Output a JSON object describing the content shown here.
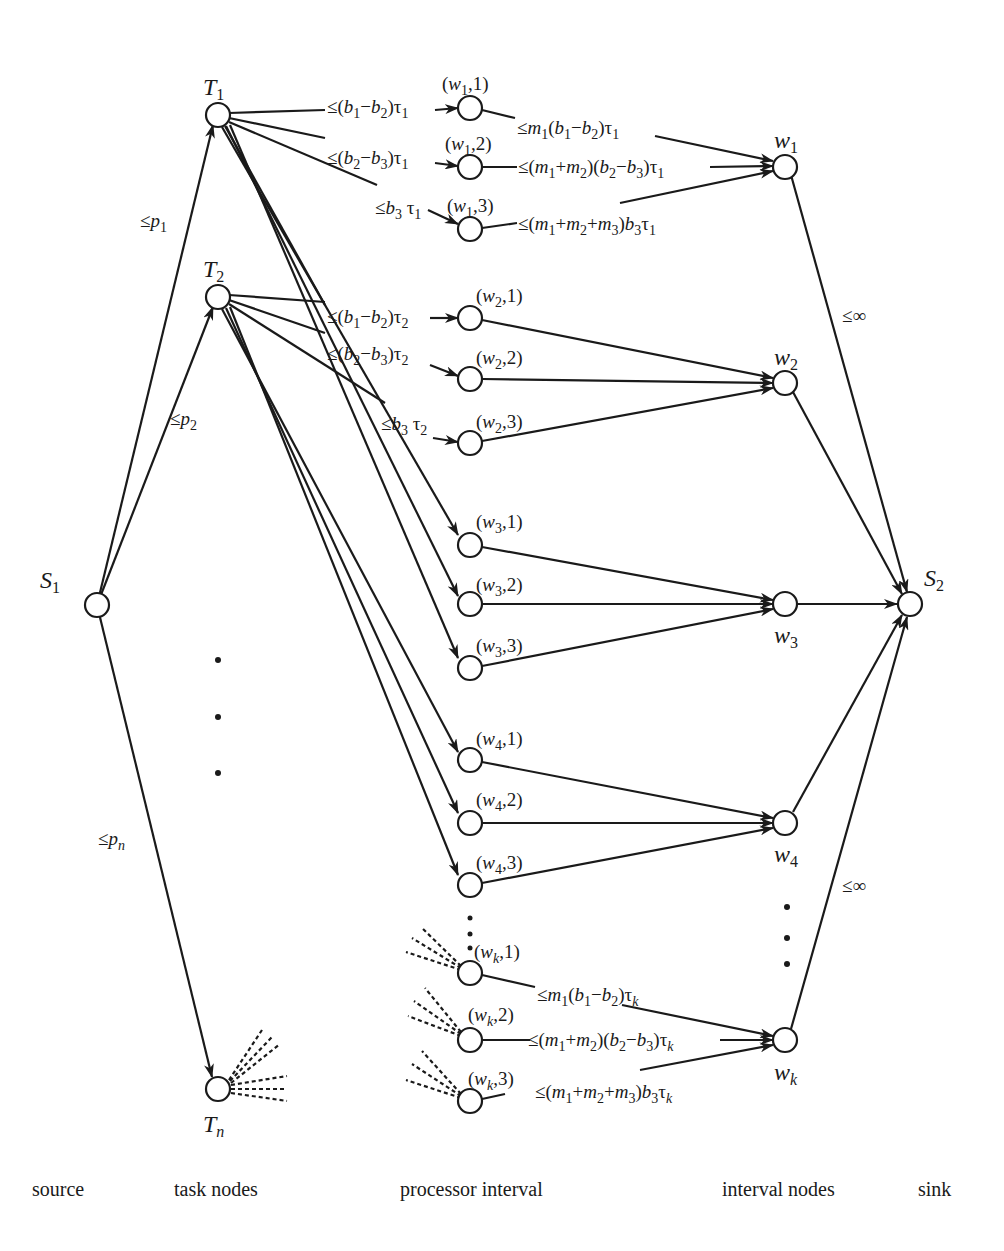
{
  "diagram": {
    "type": "flow-network",
    "columns": {
      "source": "source",
      "task_nodes": "task nodes",
      "processor_interval": "processor interval",
      "interval_nodes": "interval nodes",
      "sink": "sink"
    },
    "nodes": {
      "source": "S1",
      "sink": "S2",
      "tasks": [
        "T1",
        "T2",
        "Tn"
      ],
      "intervals": [
        "w1",
        "w2",
        "w3",
        "w4",
        "wk"
      ],
      "processor_intervals": [
        "(w1,1)",
        "(w1,2)",
        "(w1,3)",
        "(w2,1)",
        "(w2,2)",
        "(w2,3)",
        "(w3,1)",
        "(w3,2)",
        "(w3,3)",
        "(w4,1)",
        "(w4,2)",
        "(w4,3)",
        "(wk,1)",
        "(wk,2)",
        "(wk,3)"
      ]
    },
    "edge_labels": {
      "s1_t1": "≤p1",
      "s1_t2": "≤p2",
      "s1_tn": "≤pn",
      "t1_w11": "≤(b1−b2)τ1",
      "t1_w12": "≤(b2−b3)τ1",
      "t1_w13": "≤b3 τ1",
      "t2_w21": "≤(b1−b2)τ2",
      "t2_w22": "≤(b2−b3)τ2",
      "t2_w23": "≤b3 τ2",
      "w11_w1": "≤m1(b1−b2)τ1",
      "w12_w1": "≤(m1+m2)(b2−b3)τ1",
      "w13_w1": "≤(m1+m2+m3)b3τ1",
      "wk1_wk": "≤m1(b1−b2)τk",
      "wk2_wk": "≤(m1+m2)(b2−b3)τk",
      "wk3_wk": "≤(m1+m2+m3)b3τk",
      "w1_s2": "≤∞",
      "wk_s2": "≤∞"
    }
  }
}
